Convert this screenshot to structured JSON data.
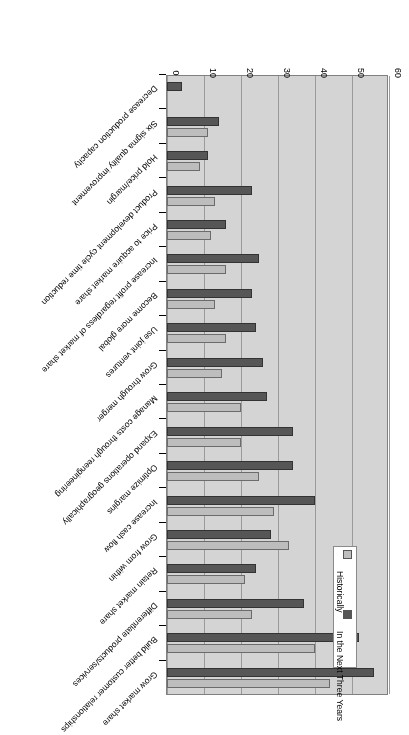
{
  "chart_data": {
    "type": "bar",
    "orientation": "horizontal",
    "title": "",
    "xlabel": "# of Responses",
    "ylabel": "",
    "xlim": [
      0,
      60
    ],
    "xticks": [
      0,
      10,
      20,
      30,
      40,
      50,
      60
    ],
    "grid": true,
    "legend_position": "top-left-inside",
    "categories": [
      "Grow market share",
      "Build better customer relationships",
      "Differentiate products/services",
      "Retain market share",
      "Grow from within",
      "Increase cash flow",
      "Optimize margins",
      "Expand operations geographically",
      "Manage costs through reengineering",
      "Grow through merger",
      "Use joint ventures",
      "Become more global",
      "Increase profit regardless of market share",
      "Price to acquire market share",
      "Product development cycle time reduction",
      "Hold price/margin",
      "Six sigma quality improvement",
      "Decrease production capacity"
    ],
    "series": [
      {
        "name": "Historically",
        "color": "#bdbdbd",
        "values": [
          44,
          40,
          23,
          21,
          33,
          29,
          25,
          20,
          20,
          15,
          16,
          13,
          16,
          12,
          13,
          9,
          11,
          0
        ]
      },
      {
        "name": "In the Next Three Years",
        "color": "#565656",
        "values": [
          56,
          52,
          37,
          24,
          28,
          40,
          34,
          34,
          27,
          26,
          24,
          23,
          25,
          16,
          23,
          11,
          14,
          4
        ]
      }
    ]
  },
  "axis": {
    "value_axis_title": "# of Responses",
    "value_ticks": [
      "0",
      "10",
      "20",
      "30",
      "40",
      "50",
      "60"
    ]
  },
  "legend": {
    "entries": [
      {
        "label": "Historically",
        "color": "#bdbdbd"
      },
      {
        "label": "In the Next Three Years",
        "color": "#565656"
      }
    ]
  }
}
